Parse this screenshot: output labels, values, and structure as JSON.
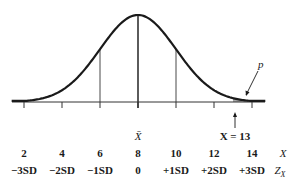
{
  "chart_data": {
    "type": "area",
    "title": "",
    "distribution": {
      "mean": 8,
      "sd": 2
    },
    "mean_label": "X̄",
    "highlight": {
      "label": "X = 13",
      "value": 13,
      "tail": "right",
      "area_label": "p"
    },
    "x_ticks": [
      2,
      4,
      6,
      8,
      10,
      12,
      14
    ],
    "x_tick_labels": [
      "2",
      "4",
      "6",
      "8",
      "10",
      "12",
      "14"
    ],
    "z_tick_labels": [
      "−3SD",
      "−2SD",
      "−1SD",
      "0",
      "+1SD",
      "+2SD",
      "+3SD"
    ],
    "row_labels": {
      "x": "X",
      "z": "Z",
      "z_sub": "X"
    },
    "vertical_lines_at": [
      6,
      8,
      10
    ],
    "xlabel": "",
    "ylabel": "",
    "grid": false,
    "legend": null
  },
  "labels": {
    "mean": "X̄",
    "x_eq": "X = 13",
    "p": "p",
    "x_row_name": "X",
    "z_row_name": "Z",
    "z_row_sub": "X",
    "x_values": [
      "2",
      "4",
      "6",
      "8",
      "10",
      "12",
      "14"
    ],
    "z_values": [
      "−3SD",
      "−2SD",
      "−1SD",
      "0",
      "+1SD",
      "+2SD",
      "+3SD"
    ]
  },
  "colors": {
    "curve": "#1a1a1a",
    "shade": "#a8a8a8",
    "axis": "#333333"
  }
}
